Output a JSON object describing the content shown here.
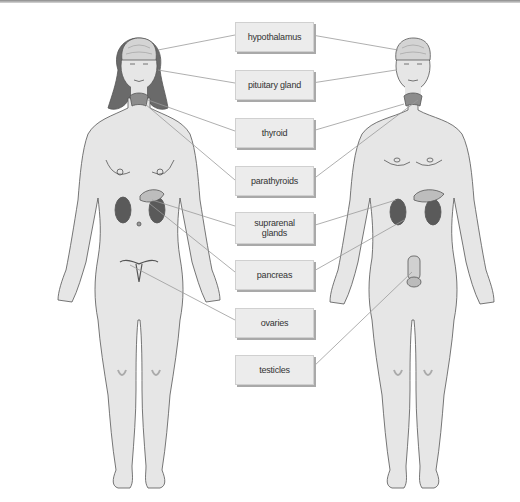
{
  "diagram": {
    "type": "endocrine-glands-anatomy",
    "figures": [
      "female",
      "male"
    ],
    "colors": {
      "skin": "#e6e6e6",
      "outline": "#555555",
      "hair": "#6a6a6a",
      "gland": "#8c8c8c",
      "kidney": "#5a5a5a",
      "leader_line": "#9a9a9a",
      "label_bg": "#ececec",
      "label_shadow": "#a9a9a9"
    },
    "labels": [
      {
        "id": "hypothalamus",
        "text": "hypothalamus",
        "female": true,
        "male": true
      },
      {
        "id": "pituitary",
        "text": "pituitary gland",
        "female": true,
        "male": true
      },
      {
        "id": "thyroid",
        "text": "thyroid",
        "female": true,
        "male": true
      },
      {
        "id": "parathyroids",
        "text": "parathyroids",
        "female": true,
        "male": true
      },
      {
        "id": "suprarenal",
        "text": "suprarenal glands",
        "female": true,
        "male": true
      },
      {
        "id": "pancreas",
        "text": "pancreas",
        "female": true,
        "male": true
      },
      {
        "id": "ovaries",
        "text": "ovaries",
        "female": true,
        "male": false
      },
      {
        "id": "testicles",
        "text": "testicles",
        "female": false,
        "male": true
      }
    ]
  }
}
